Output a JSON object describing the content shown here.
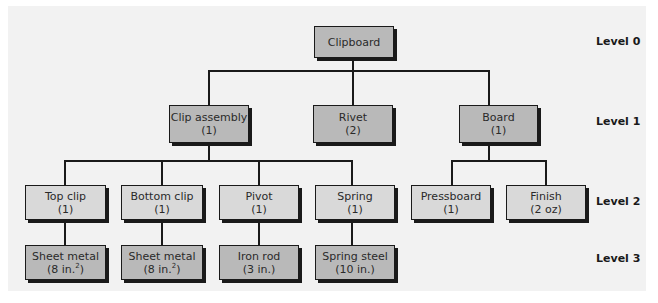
{
  "levels": [
    "Level 0",
    "Level 1",
    "Level 2",
    "Level 3"
  ],
  "nodes": {
    "clipboard": {
      "name": "Clipboard",
      "qty": ""
    },
    "clip_assembly": {
      "name": "Clip assembly",
      "qty": "(1)"
    },
    "rivet": {
      "name": "Rivet",
      "qty": "(2)"
    },
    "board": {
      "name": "Board",
      "qty": "(1)"
    },
    "top_clip": {
      "name": "Top clip",
      "qty": "(1)"
    },
    "bottom_clip": {
      "name": "Bottom clip",
      "qty": "(1)"
    },
    "pivot": {
      "name": "Pivot",
      "qty": "(1)"
    },
    "spring": {
      "name": "Spring",
      "qty": "(1)"
    },
    "pressboard": {
      "name": "Pressboard",
      "qty": "(1)"
    },
    "finish": {
      "name": "Finish",
      "qty": "(2 oz)"
    },
    "sheet_metal_1": {
      "name": "Sheet metal",
      "qty": "(8 in.",
      "sup": "2",
      "qty_end": ")"
    },
    "sheet_metal_2": {
      "name": "Sheet metal",
      "qty": "(8 in.",
      "sup": "2",
      "qty_end": ")"
    },
    "iron_rod": {
      "name": "Iron rod",
      "qty": "(3 in.)"
    },
    "spring_steel": {
      "name": "Spring steel",
      "qty": "(10 in.)"
    }
  }
}
